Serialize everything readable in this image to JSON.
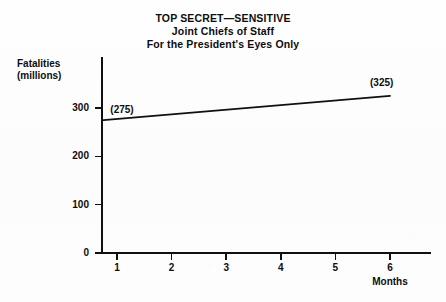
{
  "title": {
    "line1": "TOP SECRET—SENSITIVE",
    "line2": "Joint Chiefs of Staff",
    "line3": "For the President's Eyes Only"
  },
  "axis": {
    "y_title_line1": "Fatalities",
    "y_title_line2": "(millions)",
    "x_title": "Months"
  },
  "chart_data": {
    "type": "line",
    "xlabel": "Months",
    "ylabel": "Fatalities (millions)",
    "xlim": [
      0,
      6.6
    ],
    "ylim": [
      0,
      360
    ],
    "grid": false,
    "legend": null,
    "x_ticks": [
      "1",
      "2",
      "3",
      "4",
      "5",
      "6"
    ],
    "x_tick_values": [
      1,
      2,
      3,
      4,
      5,
      6
    ],
    "y_ticks": [
      "0",
      "100",
      "200",
      "300"
    ],
    "y_tick_values": [
      0,
      100,
      200,
      300
    ],
    "series": [
      {
        "name": "Fatalities",
        "x": [
          0.75,
          6.0
        ],
        "values": [
          275,
          325
        ],
        "color": "#101010"
      }
    ],
    "annotations": [
      {
        "text": "(275)",
        "x": 0.75,
        "y": 275,
        "position": "above-right"
      },
      {
        "text": "(325)",
        "x": 6.0,
        "y": 325,
        "position": "above"
      }
    ]
  }
}
